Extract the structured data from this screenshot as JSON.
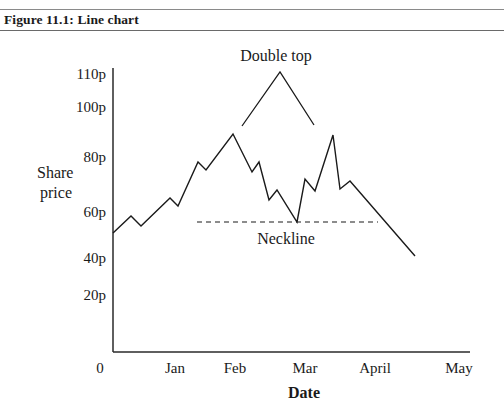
{
  "figure": {
    "title": "Figure 11.1: Line chart"
  },
  "chart_data": {
    "type": "line",
    "title": "Figure 11.1: Line chart",
    "xlabel": "Date",
    "ylabel": "Share price",
    "x_ticks": [
      "0",
      "Jan",
      "Feb",
      "Mar",
      "April",
      "May"
    ],
    "y_ticks": [
      "0",
      "20p",
      "40p",
      "60p",
      "80p",
      "100p",
      "110p"
    ],
    "ylim": [
      0,
      110
    ],
    "grid": false,
    "legend": null,
    "series": [
      {
        "name": "Share price",
        "points": [
          {
            "x": "Dec end",
            "y": 52
          },
          {
            "x": "early Jan",
            "y": 58
          },
          {
            "x": "early Jan",
            "y": 54
          },
          {
            "x": "late Jan",
            "y": 64
          },
          {
            "x": "late Jan",
            "y": 61
          },
          {
            "x": "mid Feb-",
            "y": 77
          },
          {
            "x": "mid Feb-",
            "y": 74
          },
          {
            "x": "Feb",
            "y": 89
          },
          {
            "x": "mid Feb",
            "y": 74
          },
          {
            "x": "mid Feb",
            "y": 78
          },
          {
            "x": "late Feb",
            "y": 64
          },
          {
            "x": "late Feb",
            "y": 68
          },
          {
            "x": "Mar",
            "y": 55
          },
          {
            "x": "Mar",
            "y": 72
          },
          {
            "x": "Mar",
            "y": 67
          },
          {
            "x": "mid Mar",
            "y": 88
          },
          {
            "x": "late Mar",
            "y": 68
          },
          {
            "x": "late Mar",
            "y": 71
          },
          {
            "x": "April",
            "y": 55
          },
          {
            "x": "mid April",
            "y": 42
          }
        ]
      }
    ],
    "annotations": [
      {
        "text": "Double top",
        "type": "caret",
        "position": "above peaks"
      },
      {
        "text": "Neckline",
        "type": "dashed-hline",
        "y": 55
      }
    ]
  },
  "render": {
    "polyline": "113,233 131,216 141,226 170,198 178,206 198,162 206,170 233,134 252,172 259,162 269,200 277,190 297,222 305,179 315,191 333,135 340,189 350,181 415,256",
    "double_top_caret": "242,126 280,72 314,125",
    "neckline": {
      "x1": 197,
      "x2": 378,
      "y": 222
    },
    "y_ticks_pos": [
      {
        "label": "110p",
        "y": 79
      },
      {
        "label": "100p",
        "y": 112
      },
      {
        "label": "80p",
        "y": 162
      },
      {
        "label": "60p",
        "y": 217
      },
      {
        "label": "40p",
        "y": 263
      },
      {
        "label": "20p",
        "y": 300
      }
    ],
    "x_ticks_pos": [
      {
        "label": "0",
        "x": 100
      },
      {
        "label": "Jan",
        "x": 175
      },
      {
        "label": "Feb",
        "x": 235
      },
      {
        "label": "Mar",
        "x": 305
      },
      {
        "label": "April",
        "x": 375
      },
      {
        "label": "May",
        "x": 459
      }
    ]
  }
}
